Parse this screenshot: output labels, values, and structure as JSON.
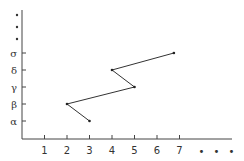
{
  "chart_data": {
    "type": "line",
    "title": "",
    "xlabel": "",
    "ylabel": "",
    "x_ticks": [
      "1",
      "2",
      "3",
      "4",
      "5",
      "6",
      "7"
    ],
    "x_continuation": "• • •",
    "y_ticks": [
      "α",
      "β",
      "γ",
      "δ",
      "σ"
    ],
    "y_continuation": [
      "•",
      "•",
      "•"
    ],
    "series": [
      {
        "name": "path",
        "points": [
          {
            "x": 3,
            "y": "α"
          },
          {
            "x": 2,
            "y": "β"
          },
          {
            "x": 5,
            "y": "γ"
          },
          {
            "x": 4,
            "y": "δ"
          },
          {
            "x": 6.75,
            "y": "σ"
          }
        ]
      }
    ],
    "grid": false,
    "legend": null,
    "colors": {
      "axis": "#444444",
      "line": "#333333",
      "text": "#333333"
    }
  }
}
